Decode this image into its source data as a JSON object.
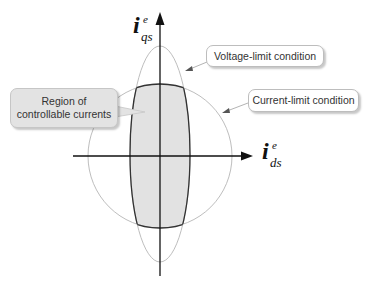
{
  "diagram": {
    "title": "",
    "axes": {
      "vertical": {
        "symbol": "i",
        "superscript": "e",
        "subscript": "qs"
      },
      "horizontal": {
        "symbol": "i",
        "superscript": "e",
        "subscript": "ds"
      }
    },
    "callouts": {
      "voltage_limit": "Voltage-limit condition",
      "current_limit": "Current-limit condition",
      "region_line1": "Region of",
      "region_line2": "controllable currents"
    },
    "colors": {
      "axis": "#111111",
      "limit_curves": "#b5b5b5",
      "region_fill": "#e2e2e2",
      "region_outline": "#333333",
      "callout_border": "#bdbdbd"
    }
  }
}
